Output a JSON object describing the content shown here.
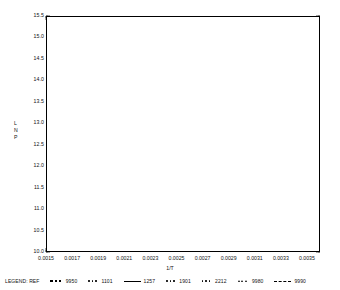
{
  "chart_data": {
    "type": "scatter",
    "title": "",
    "xlabel": "1/T",
    "ylabel": "LN P",
    "xlim": [
      0.0015,
      0.0036
    ],
    "ylim": [
      10.0,
      15.5
    ],
    "grid": false,
    "legend_position": "bottom",
    "x_ticks": [
      "0.0015",
      "0.0017",
      "0.0019",
      "0.0021",
      "0.0023",
      "0.0025",
      "0.0027",
      "0.0029",
      "0.0031",
      "0.0033",
      "0.0035"
    ],
    "x_tick_values": [
      0.0015,
      0.0017,
      0.0019,
      0.0021,
      0.0023,
      0.0025,
      0.0027,
      0.0029,
      0.0031,
      0.0033,
      0.0035
    ],
    "y_ticks": [
      "15.5",
      "15.0",
      "14.5",
      "14.0",
      "13.5",
      "13.0",
      "12.5",
      "12.0",
      "11.5",
      "11.0",
      "10.5",
      "10.0"
    ],
    "y_tick_values": [
      15.5,
      15.0,
      14.5,
      14.0,
      13.5,
      13.0,
      12.5,
      12.0,
      11.5,
      11.0,
      10.5,
      10.0
    ],
    "series": [
      {
        "name": "1257",
        "style": "line",
        "x": [
          0.002005,
          0.003455
        ],
        "values": [
          15.06,
          10.15
        ]
      },
      {
        "name": "data points",
        "style": "markers",
        "x": [
          0.002005,
          0.00203,
          0.002055,
          0.00208,
          0.002105,
          0.00213,
          0.00215,
          0.00217,
          0.00219,
          0.00221,
          0.00223,
          0.00225,
          0.002268,
          0.002286,
          0.002304,
          0.002322,
          0.00234,
          0.002358,
          0.002376,
          0.002394,
          0.002412,
          0.00243,
          0.002448,
          0.002466,
          0.002484,
          0.002502,
          0.00252,
          0.00254,
          0.00256,
          0.00258,
          0.0026,
          0.00262,
          0.00264,
          0.00266,
          0.00268,
          0.0027,
          0.002725,
          0.00275,
          0.002775,
          0.0028,
          0.002825,
          0.00285,
          0.00288,
          0.00291,
          0.00294,
          0.00297,
          0.003,
          0.00303,
          0.00306,
          0.00309,
          0.00312,
          0.00315,
          0.00318,
          0.00321,
          0.00324,
          0.00327,
          0.0033,
          0.00333,
          0.00336,
          0.00339,
          0.00342,
          0.003455
        ],
        "values": [
          15.06,
          14.97,
          14.89,
          14.8,
          14.72,
          14.63,
          14.57,
          14.5,
          14.43,
          14.36,
          14.29,
          14.22,
          14.16,
          14.1,
          14.04,
          13.98,
          13.92,
          13.86,
          13.8,
          13.74,
          13.68,
          13.62,
          13.56,
          13.5,
          13.44,
          13.38,
          13.32,
          13.25,
          13.18,
          13.12,
          13.05,
          12.98,
          12.91,
          12.85,
          12.78,
          12.71,
          12.63,
          12.54,
          12.46,
          12.38,
          12.29,
          12.21,
          12.11,
          12.01,
          11.91,
          11.81,
          11.71,
          11.61,
          11.51,
          11.41,
          11.3,
          11.2,
          11.1,
          11.0,
          10.9,
          10.8,
          10.7,
          10.6,
          10.5,
          10.4,
          10.29,
          10.15
        ]
      }
    ],
    "legend": {
      "title": "LEGEND: REF",
      "entries": [
        {
          "label": "9950",
          "symbol": "square"
        },
        {
          "label": "1101",
          "symbol": "dots"
        },
        {
          "label": "1257",
          "symbol": "solid-line"
        },
        {
          "label": "1901",
          "symbol": "dots"
        },
        {
          "label": "2212",
          "symbol": "dots"
        },
        {
          "label": "9980",
          "symbol": "triangles"
        },
        {
          "label": "9990",
          "symbol": "dashed-line"
        }
      ]
    }
  }
}
